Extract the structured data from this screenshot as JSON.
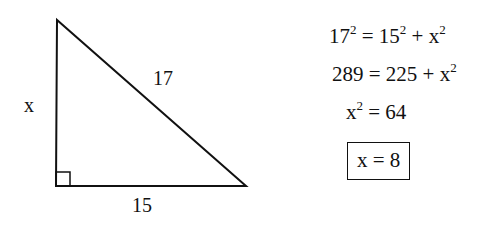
{
  "diagram": {
    "type": "right-triangle",
    "vertices": {
      "top": [
        57,
        20
      ],
      "bottom_left": [
        56,
        186
      ],
      "bottom_right": [
        246,
        186
      ]
    },
    "right_angle_marker": true,
    "labels": {
      "vertical_leg": "x",
      "hypotenuse": "17",
      "horizontal_leg": "15"
    },
    "stroke_color": "#111111"
  },
  "solution": {
    "line1": {
      "lhs_base": "17",
      "lhs_exp": "2",
      "eq": " = ",
      "a_base": "15",
      "a_exp": "2",
      "plus": " + ",
      "b_base": "x",
      "b_exp": "2"
    },
    "line2": {
      "lhs": "289",
      "eq": " = ",
      "a": "225",
      "plus": " + ",
      "b_base": "x",
      "b_exp": "2"
    },
    "line3": {
      "lhs_base": "x",
      "lhs_exp": "2",
      "eq": " = ",
      "rhs": "64"
    },
    "answer": "x = 8"
  }
}
